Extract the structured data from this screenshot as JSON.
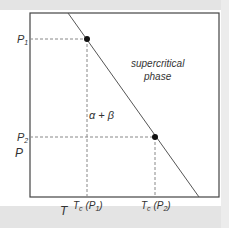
{
  "diagram": {
    "type": "phase-diagram",
    "x_axis_label": "T",
    "y_axis_label": "P",
    "y_ticks": [
      {
        "label": "P",
        "sub": "1"
      },
      {
        "label": "P",
        "sub": "2"
      }
    ],
    "x_ticks": [
      {
        "label": "T",
        "sub": "c",
        "arg": "(P",
        "argsub": "1",
        "close": ")"
      },
      {
        "label": "T",
        "sub": "c",
        "arg": "(P",
        "argsub": "2",
        "close": ")"
      }
    ],
    "region_labels": {
      "supercritical_line1": "supercritical",
      "supercritical_line2": "phase",
      "two_phase": "α + β"
    },
    "points": [
      {
        "name": "critical-point-P1",
        "x": "Tc(P1)",
        "y": "P1"
      },
      {
        "name": "critical-point-P2",
        "x": "Tc(P2)",
        "y": "P2"
      }
    ],
    "colors": {
      "line": "#555555",
      "dashed": "#888888",
      "dot": "#111111",
      "frame": "#444444",
      "band": "#e4e4e4"
    }
  }
}
